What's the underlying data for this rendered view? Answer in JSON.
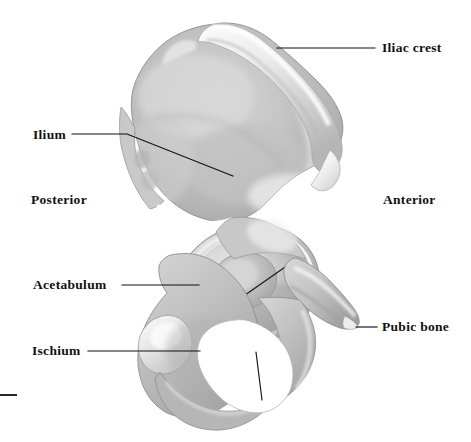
{
  "figure": {
    "background_color": "#ffffff",
    "width": 471,
    "height": 442
  },
  "labels": [
    {
      "id": "iliac-crest",
      "text": "Iliac crest",
      "x": 382,
      "y": 41,
      "leader": {
        "x1": 277,
        "y1": 48,
        "x2": 375,
        "y2": 48
      }
    },
    {
      "id": "ilium",
      "text": "Ilium",
      "x": 33,
      "y": 128,
      "leader": {
        "x1": 72,
        "y1": 134,
        "x2": 127,
        "y2": 134,
        "x3": 233,
        "y3": 176
      }
    },
    {
      "id": "acetabulum",
      "text": "Acetabulum",
      "x": 33,
      "y": 278,
      "leader": {
        "x1": 122,
        "y1": 285,
        "x2": 199,
        "y2": 285
      }
    },
    {
      "id": "ischium",
      "text": "Ischium",
      "x": 32,
      "y": 344,
      "leader": {
        "x1": 88,
        "y1": 351,
        "x2": 200,
        "y2": 351
      }
    },
    {
      "id": "pubic-bone",
      "text": "Pubic bone",
      "x": 382,
      "y": 320,
      "leader": {
        "x1": 356,
        "y1": 327,
        "x2": 377,
        "y2": 327
      }
    }
  ],
  "orientation_labels": [
    {
      "id": "posterior",
      "text": "Posterior",
      "x": 31,
      "y": 193
    },
    {
      "id": "anterior",
      "text": "Anterior",
      "x": 383,
      "y": 193
    }
  ],
  "colors": {
    "bone_light": "#f4f4f4",
    "bone_mid": "#c4c4c4",
    "bone_shade": "#a9a9a9",
    "bone_dark": "#8e8e8e",
    "outline": "#7d7d7d",
    "leader_line": "#1a1a1a",
    "text": "#111111",
    "background": "#ffffff"
  },
  "bone_regions": [
    {
      "name": "ilium",
      "description": "large fan-shaped superior wing"
    },
    {
      "name": "iliac-crest",
      "description": "thickened superior ridge of the ilium"
    },
    {
      "name": "acetabulum",
      "description": "cup-shaped socket with triradiate Y suture lines"
    },
    {
      "name": "ischium",
      "description": "inferoposterior portion below the acetabulum"
    },
    {
      "name": "pubic-bone",
      "description": "anterior projecting ramus ending in a point"
    },
    {
      "name": "obturator-foramen",
      "description": "large oval opening inferior to the acetabulum"
    },
    {
      "name": "greater-sciatic-notch",
      "description": "posterior concavity above the ischial spine"
    }
  ],
  "page_rule": {
    "present": true,
    "x": 0,
    "y": 394,
    "width": 17
  }
}
